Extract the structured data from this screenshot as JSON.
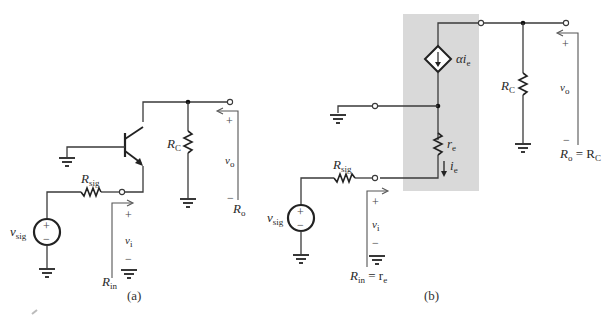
{
  "figure": {
    "panels": [
      {
        "id": "a",
        "caption": "(a)",
        "labels": {
          "rsig_main": "R",
          "rsig_sub": "sig",
          "rc_main": "R",
          "rc_sub": "C",
          "vsig_main": "v",
          "vsig_sub": "sig",
          "vi_main": "v",
          "vi_sub": "i",
          "vo_main": "v",
          "vo_sub": "o",
          "rin_main": "R",
          "rin_sub": "in",
          "ro_main": "R",
          "ro_sub": "o",
          "plus": "+",
          "minus": "−"
        }
      },
      {
        "id": "b",
        "caption": "(b)",
        "labels": {
          "alpha_ie": "αi",
          "alpha_ie_sub": "e",
          "re_main": "r",
          "re_sub": "e",
          "ie_main": "i",
          "ie_sub": "e",
          "rsig_main": "R",
          "rsig_sub": "sig",
          "rc_main": "R",
          "rc_sub": "C",
          "vsig_main": "v",
          "vsig_sub": "sig",
          "vi_main": "v",
          "vi_sub": "i",
          "vo_main": "v",
          "vo_sub": "o",
          "rin_eq": "R",
          "rin_eq_sub": "in",
          "rin_eq_rhs": " = r",
          "rin_eq_rhs_sub": "e",
          "ro_eq": "R",
          "ro_eq_sub": "o",
          "ro_eq_rhs": " = R",
          "ro_eq_rhs_sub": "C",
          "plus": "+",
          "minus": "−"
        }
      }
    ],
    "colors": {
      "wire": "#3a3a3a",
      "shaded_box": "#d9d9d9"
    }
  }
}
